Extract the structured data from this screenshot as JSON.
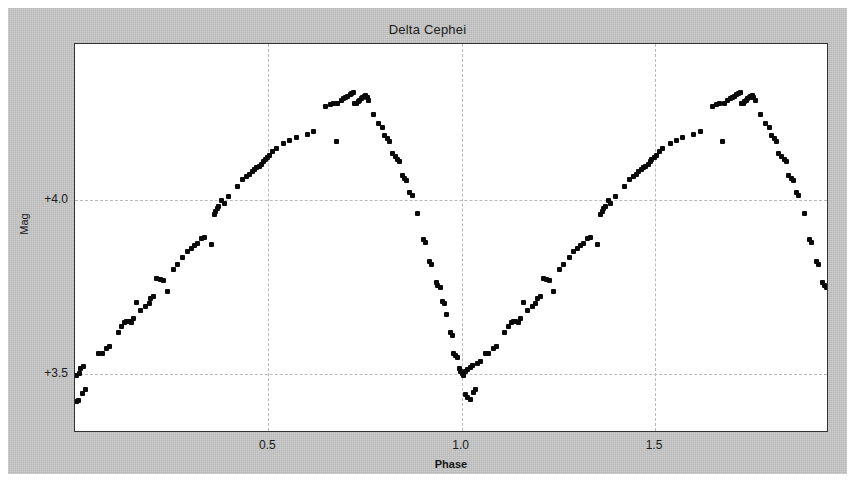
{
  "chart_data": {
    "type": "scatter",
    "title": "Delta Cephei",
    "xlabel": "Phase",
    "ylabel": "Mag",
    "xlim": [
      0.0,
      1.95
    ],
    "ylim": [
      4.45,
      3.33
    ],
    "y_inverted": true,
    "grid": true,
    "legend": "none",
    "xticks": [
      0.5,
      1.0,
      1.5
    ],
    "xtick_labels": [
      "0.5",
      "1.0",
      "1.5"
    ],
    "yticks": [
      3.5,
      4.0
    ],
    "ytick_labels": [
      "+3.5",
      "+4.0"
    ],
    "marker_color": "#0a0a0a",
    "marker_size_px": 5,
    "background_color": "#c3c3c3",
    "plot_background_color": "#ffffff",
    "grid_color": "#b9b9b9",
    "axis_color": "#333333",
    "period_phase": 1.0,
    "series_name": "Delta Cephei V magnitude",
    "points": [
      [
        0.005,
        3.42
      ],
      [
        0.01,
        3.425
      ],
      [
        0.02,
        3.445
      ],
      [
        0.028,
        3.455
      ],
      [
        0.005,
        3.495
      ],
      [
        0.012,
        3.5
      ],
      [
        0.014,
        3.515
      ],
      [
        0.022,
        3.522
      ],
      [
        0.062,
        3.56
      ],
      [
        0.07,
        3.558
      ],
      [
        0.082,
        3.572
      ],
      [
        0.09,
        3.578
      ],
      [
        0.112,
        3.62
      ],
      [
        0.12,
        3.636
      ],
      [
        0.128,
        3.648
      ],
      [
        0.134,
        3.65
      ],
      [
        0.14,
        3.652
      ],
      [
        0.146,
        3.647
      ],
      [
        0.152,
        3.66
      ],
      [
        0.17,
        3.682
      ],
      [
        0.182,
        3.694
      ],
      [
        0.192,
        3.702
      ],
      [
        0.16,
        3.706
      ],
      [
        0.196,
        3.716
      ],
      [
        0.204,
        3.722
      ],
      [
        0.238,
        3.738
      ],
      [
        0.228,
        3.768
      ],
      [
        0.22,
        3.772
      ],
      [
        0.212,
        3.776
      ],
      [
        0.254,
        3.8
      ],
      [
        0.264,
        3.816
      ],
      [
        0.278,
        3.836
      ],
      [
        0.29,
        3.852
      ],
      [
        0.3,
        3.862
      ],
      [
        0.308,
        3.87
      ],
      [
        0.316,
        3.876
      ],
      [
        0.352,
        3.872
      ],
      [
        0.326,
        3.89
      ],
      [
        0.334,
        3.894
      ],
      [
        0.36,
        3.96
      ],
      [
        0.364,
        3.968
      ],
      [
        0.368,
        3.975
      ],
      [
        0.372,
        3.982
      ],
      [
        0.386,
        3.992
      ],
      [
        0.38,
        4.0
      ],
      [
        0.398,
        4.01
      ],
      [
        0.42,
        4.04
      ],
      [
        0.434,
        4.06
      ],
      [
        0.444,
        4.068
      ],
      [
        0.452,
        4.075
      ],
      [
        0.458,
        4.082
      ],
      [
        0.464,
        4.09
      ],
      [
        0.47,
        4.095
      ],
      [
        0.476,
        4.098
      ],
      [
        0.482,
        4.104
      ],
      [
        0.488,
        4.112
      ],
      [
        0.492,
        4.118
      ],
      [
        0.498,
        4.122
      ],
      [
        0.504,
        4.128
      ],
      [
        0.512,
        4.14
      ],
      [
        0.52,
        4.148
      ],
      [
        0.54,
        4.164
      ],
      [
        0.556,
        4.172
      ],
      [
        0.572,
        4.18
      ],
      [
        0.6,
        4.19
      ],
      [
        0.618,
        4.198
      ],
      [
        0.675,
        4.168
      ],
      [
        0.648,
        4.27
      ],
      [
        0.66,
        4.276
      ],
      [
        0.668,
        4.278
      ],
      [
        0.68,
        4.28
      ],
      [
        0.688,
        4.286
      ],
      [
        0.694,
        4.292
      ],
      [
        0.7,
        4.296
      ],
      [
        0.706,
        4.3
      ],
      [
        0.712,
        4.304
      ],
      [
        0.716,
        4.308
      ],
      [
        0.72,
        4.31
      ],
      [
        0.724,
        4.278
      ],
      [
        0.728,
        4.28
      ],
      [
        0.732,
        4.284
      ],
      [
        0.736,
        4.288
      ],
      [
        0.74,
        4.292
      ],
      [
        0.744,
        4.296
      ],
      [
        0.748,
        4.3
      ],
      [
        0.752,
        4.302
      ],
      [
        0.756,
        4.296
      ],
      [
        0.76,
        4.288
      ],
      [
        0.772,
        4.248
      ],
      [
        0.786,
        4.22
      ],
      [
        0.796,
        4.21
      ],
      [
        0.8,
        4.186
      ],
      [
        0.808,
        4.178
      ],
      [
        0.814,
        4.17
      ],
      [
        0.82,
        4.136
      ],
      [
        0.828,
        4.126
      ],
      [
        0.834,
        4.118
      ],
      [
        0.84,
        4.112
      ],
      [
        0.846,
        4.07
      ],
      [
        0.852,
        4.062
      ],
      [
        0.858,
        4.056
      ],
      [
        0.866,
        4.022
      ],
      [
        0.872,
        4.014
      ],
      [
        0.886,
        3.962
      ],
      [
        0.9,
        3.888
      ],
      [
        0.906,
        3.878
      ],
      [
        0.918,
        3.824
      ],
      [
        0.922,
        3.816
      ],
      [
        0.934,
        3.762
      ],
      [
        0.938,
        3.756
      ],
      [
        0.944,
        3.748
      ],
      [
        0.95,
        3.708
      ],
      [
        0.956,
        3.702
      ],
      [
        0.962,
        3.67
      ],
      [
        0.97,
        3.618
      ],
      [
        0.976,
        3.61
      ],
      [
        0.98,
        3.56
      ],
      [
        0.984,
        3.552
      ],
      [
        0.988,
        3.548
      ],
      [
        0.994,
        3.516
      ],
      [
        0.998,
        3.508
      ],
      [
        1.002,
        3.5
      ],
      [
        1.006,
        3.496
      ],
      [
        1.01,
        3.44
      ],
      [
        1.016,
        3.432
      ],
      [
        1.022,
        3.426
      ],
      [
        1.03,
        3.448
      ],
      [
        1.036,
        3.454
      ],
      [
        1.01,
        3.506
      ],
      [
        1.016,
        3.512
      ],
      [
        1.022,
        3.518
      ],
      [
        1.028,
        3.524
      ],
      [
        1.042,
        3.53
      ],
      [
        1.048,
        3.536
      ],
      [
        1.062,
        3.56
      ],
      [
        1.07,
        3.558
      ],
      [
        1.082,
        3.572
      ],
      [
        1.09,
        3.578
      ],
      [
        1.112,
        3.62
      ],
      [
        1.12,
        3.636
      ],
      [
        1.128,
        3.648
      ],
      [
        1.134,
        3.65
      ],
      [
        1.14,
        3.652
      ],
      [
        1.146,
        3.647
      ],
      [
        1.152,
        3.66
      ],
      [
        1.17,
        3.682
      ],
      [
        1.182,
        3.694
      ],
      [
        1.192,
        3.702
      ],
      [
        1.16,
        3.706
      ],
      [
        1.196,
        3.716
      ],
      [
        1.204,
        3.722
      ],
      [
        1.238,
        3.738
      ],
      [
        1.228,
        3.768
      ],
      [
        1.22,
        3.772
      ],
      [
        1.212,
        3.776
      ],
      [
        1.254,
        3.8
      ],
      [
        1.264,
        3.816
      ],
      [
        1.278,
        3.836
      ],
      [
        1.29,
        3.852
      ],
      [
        1.3,
        3.862
      ],
      [
        1.308,
        3.87
      ],
      [
        1.316,
        3.876
      ],
      [
        1.352,
        3.872
      ],
      [
        1.326,
        3.89
      ],
      [
        1.334,
        3.894
      ],
      [
        1.36,
        3.96
      ],
      [
        1.364,
        3.968
      ],
      [
        1.368,
        3.975
      ],
      [
        1.372,
        3.982
      ],
      [
        1.386,
        3.992
      ],
      [
        1.38,
        4.0
      ],
      [
        1.398,
        4.01
      ],
      [
        1.42,
        4.04
      ],
      [
        1.434,
        4.06
      ],
      [
        1.444,
        4.068
      ],
      [
        1.452,
        4.075
      ],
      [
        1.458,
        4.082
      ],
      [
        1.464,
        4.09
      ],
      [
        1.47,
        4.095
      ],
      [
        1.476,
        4.098
      ],
      [
        1.482,
        4.104
      ],
      [
        1.488,
        4.112
      ],
      [
        1.492,
        4.118
      ],
      [
        1.498,
        4.122
      ],
      [
        1.504,
        4.128
      ],
      [
        1.512,
        4.14
      ],
      [
        1.52,
        4.148
      ],
      [
        1.54,
        4.164
      ],
      [
        1.556,
        4.172
      ],
      [
        1.572,
        4.18
      ],
      [
        1.6,
        4.19
      ],
      [
        1.618,
        4.198
      ],
      [
        1.675,
        4.168
      ],
      [
        1.648,
        4.27
      ],
      [
        1.66,
        4.276
      ],
      [
        1.668,
        4.278
      ],
      [
        1.68,
        4.28
      ],
      [
        1.688,
        4.286
      ],
      [
        1.694,
        4.292
      ],
      [
        1.7,
        4.296
      ],
      [
        1.706,
        4.3
      ],
      [
        1.712,
        4.304
      ],
      [
        1.716,
        4.308
      ],
      [
        1.72,
        4.31
      ],
      [
        1.724,
        4.278
      ],
      [
        1.728,
        4.28
      ],
      [
        1.732,
        4.284
      ],
      [
        1.736,
        4.288
      ],
      [
        1.74,
        4.292
      ],
      [
        1.744,
        4.296
      ],
      [
        1.748,
        4.3
      ],
      [
        1.752,
        4.302
      ],
      [
        1.756,
        4.296
      ],
      [
        1.76,
        4.288
      ],
      [
        1.772,
        4.248
      ],
      [
        1.786,
        4.22
      ],
      [
        1.796,
        4.21
      ],
      [
        1.8,
        4.186
      ],
      [
        1.808,
        4.178
      ],
      [
        1.814,
        4.17
      ],
      [
        1.82,
        4.136
      ],
      [
        1.828,
        4.126
      ],
      [
        1.834,
        4.118
      ],
      [
        1.84,
        4.112
      ],
      [
        1.846,
        4.07
      ],
      [
        1.852,
        4.062
      ],
      [
        1.858,
        4.056
      ],
      [
        1.866,
        4.022
      ],
      [
        1.872,
        4.014
      ],
      [
        1.886,
        3.962
      ],
      [
        1.9,
        3.888
      ],
      [
        1.906,
        3.878
      ],
      [
        1.918,
        3.824
      ],
      [
        1.922,
        3.816
      ],
      [
        1.934,
        3.762
      ],
      [
        1.938,
        3.756
      ],
      [
        1.944,
        3.748
      ]
    ]
  }
}
